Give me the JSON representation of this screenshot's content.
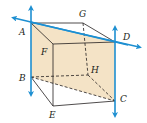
{
  "diagram": {
    "points": {
      "A": {
        "label": "A",
        "x": 31,
        "y": 23
      },
      "G": {
        "label": "G",
        "x": 83,
        "y": 23
      },
      "D": {
        "label": "D",
        "x": 115,
        "y": 42
      },
      "F": {
        "label": "F",
        "x": 53,
        "y": 44
      },
      "B": {
        "label": "B",
        "x": 31,
        "y": 77
      },
      "H": {
        "label": "H",
        "x": 88,
        "y": 75
      },
      "C": {
        "label": "C",
        "x": 115,
        "y": 101
      },
      "E": {
        "label": "E",
        "x": 53,
        "y": 106
      }
    },
    "lines": [
      {
        "name": "line-AD",
        "through": [
          "A",
          "D"
        ]
      },
      {
        "name": "line-AB",
        "through": [
          "A",
          "B"
        ]
      },
      {
        "name": "line-DC",
        "through": [
          "D",
          "C"
        ]
      }
    ],
    "shaded_plane": [
      "A",
      "D",
      "C",
      "B"
    ],
    "colors": {
      "line": "#1d8fd1",
      "fill": "#f4e3c6",
      "edge": "#231f20"
    }
  }
}
